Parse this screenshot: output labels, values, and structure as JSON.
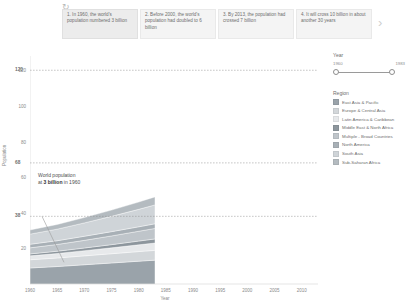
{
  "story": {
    "reset_icon": "reset-icon",
    "next_icon": "chevron-right-icon",
    "cards": [
      {
        "text": "1. In 1960, the world's population numbered 3 billion"
      },
      {
        "text": "2. Before 2000, the world's population had doubled to 6 billion"
      },
      {
        "text": "3. By 2013, the population had crossed 7 billion"
      },
      {
        "text": "4. It will cross 10 billion in about another 30 years"
      }
    ]
  },
  "controls": {
    "year": {
      "title": "Year",
      "min_label": "1960",
      "max_label": "1983"
    },
    "region": {
      "title": "Region",
      "items": [
        {
          "label": "East Asia & Pacific",
          "color": "#9aa3aa"
        },
        {
          "label": "Europe & Central Asia",
          "color": "#d3d7da"
        },
        {
          "label": "Latin America & Caribbean",
          "color": "#e7e9eb"
        },
        {
          "label": "Middle East & North Africa",
          "color": "#8d969d"
        },
        {
          "label": "Multiple - Broad Countries",
          "color": "#bfc5ca"
        },
        {
          "label": "North America",
          "color": "#a8b0b6"
        },
        {
          "label": "South Asia",
          "color": "#cfd4d8"
        },
        {
          "label": "Sub-Saharan Africa",
          "color": "#b4bbc0"
        }
      ]
    }
  },
  "annotation": {
    "line1": "World population",
    "line2_prefix": "at ",
    "line2_value": "3 billion",
    "line2_suffix": " in 1960"
  },
  "chart_data": {
    "type": "area",
    "title": "",
    "xlabel": "Year",
    "ylabel": "Population",
    "xlim": [
      1960,
      2013
    ],
    "ylim": [
      0,
      128
    ],
    "xticks": [
      1960,
      1965,
      1970,
      1975,
      1980,
      1985,
      1990,
      1995,
      2000,
      2005,
      2010
    ],
    "yticks": [
      20,
      40,
      60,
      80,
      100,
      120
    ],
    "grid": false,
    "reference_lines": [
      {
        "value": 120,
        "label": "120"
      },
      {
        "value": 68,
        "label": "68"
      },
      {
        "value": 38,
        "label": "38"
      }
    ],
    "x": [
      1960,
      1965,
      1970,
      1975,
      1980,
      1983
    ],
    "series": [
      {
        "name": "East Asia & Pacific",
        "color": "#9aa3aa",
        "values": [
          9.0,
          9.8,
          10.8,
          11.8,
          12.8,
          13.4
        ]
      },
      {
        "name": "Europe & Central Asia",
        "color": "#d3d7da",
        "values": [
          4.6,
          4.8,
          5.0,
          5.2,
          5.4,
          5.5
        ]
      },
      {
        "name": "Latin America & Caribbean",
        "color": "#e7e9eb",
        "values": [
          2.2,
          2.5,
          2.9,
          3.3,
          3.8,
          4.1
        ]
      },
      {
        "name": "Middle East & North Africa",
        "color": "#8d969d",
        "values": [
          1.1,
          1.3,
          1.5,
          1.8,
          2.1,
          2.3
        ]
      },
      {
        "name": "Multiple - Broad Countries",
        "color": "#bfc5ca",
        "values": [
          3.4,
          3.8,
          4.3,
          4.9,
          5.5,
          5.9
        ]
      },
      {
        "name": "North America",
        "color": "#a8b0b6",
        "values": [
          2.0,
          2.1,
          2.3,
          2.4,
          2.5,
          2.6
        ]
      },
      {
        "name": "South Asia",
        "color": "#cfd4d8",
        "values": [
          5.7,
          6.5,
          7.5,
          8.6,
          9.8,
          10.6
        ]
      },
      {
        "name": "Sub-Saharan Africa",
        "color": "#b4bbc0",
        "values": [
          2.3,
          2.6,
          3.0,
          3.5,
          4.1,
          4.5
        ]
      }
    ]
  }
}
